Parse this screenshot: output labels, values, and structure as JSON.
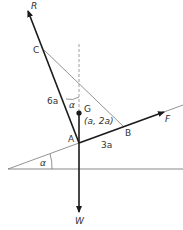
{
  "diagram": {
    "type": "mechanics force diagram",
    "points": {
      "A": {
        "label": "A",
        "x": 79,
        "y": 143
      },
      "B": {
        "label": "B",
        "x": 123,
        "y": 126
      },
      "C": {
        "label": "C",
        "x": 44,
        "y": 50
      },
      "G": {
        "label": "G",
        "x": 79,
        "y": 113,
        "coords": "(a, 2a)"
      }
    },
    "forces": {
      "R": {
        "label": "R"
      },
      "F": {
        "label": "F"
      },
      "W": {
        "label": "W"
      }
    },
    "lengths": {
      "AC": "6a",
      "AB": "3a"
    },
    "angles": {
      "top": "α",
      "bottom": "α"
    },
    "colors": {
      "thick_line": "#1a1a1a",
      "thin_line": "#777777",
      "dashed_line": "#888888",
      "text": "#333333"
    }
  }
}
